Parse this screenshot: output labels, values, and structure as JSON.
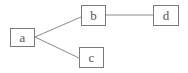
{
  "diagram": {
    "type": "tree",
    "nodes": [
      {
        "id": "a",
        "label": "a",
        "x": 10,
        "y": 28,
        "w": 25,
        "h": 19
      },
      {
        "id": "b",
        "label": "b",
        "x": 81,
        "y": 5,
        "w": 25,
        "h": 21
      },
      {
        "id": "c",
        "label": "c",
        "x": 79,
        "y": 47,
        "w": 25,
        "h": 21
      },
      {
        "id": "d",
        "label": "d",
        "x": 153,
        "y": 5,
        "w": 26,
        "h": 21
      }
    ],
    "edges": [
      {
        "from": "a",
        "to": "b"
      },
      {
        "from": "a",
        "to": "c"
      },
      {
        "from": "b",
        "to": "d"
      }
    ],
    "colors": {
      "line": "#8a8a8a",
      "border": "#7a7a7a",
      "text": "#555555",
      "background": "#ffffff"
    }
  }
}
